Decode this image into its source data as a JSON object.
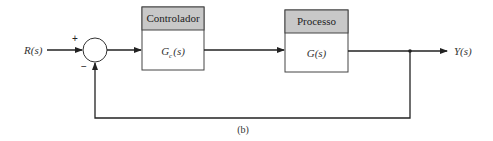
{
  "diagram": {
    "input_label": "R(s)",
    "output_label": "Y(s)",
    "caption": "(b)",
    "summing_junction": {
      "plus_sign": "+",
      "minus_sign": "−"
    },
    "blocks": [
      {
        "header": "Controlador",
        "transfer_function": "Gc(s)",
        "tf_main": "G",
        "tf_sub": "c",
        "tf_arg": "(s)"
      },
      {
        "header": "Processo",
        "transfer_function": "G(s)",
        "tf_main": "G",
        "tf_sub": "",
        "tf_arg": "(s)"
      }
    ],
    "colors": {
      "header_fill": "#c8c8c8",
      "line": "#222222",
      "text": "#333333"
    }
  }
}
